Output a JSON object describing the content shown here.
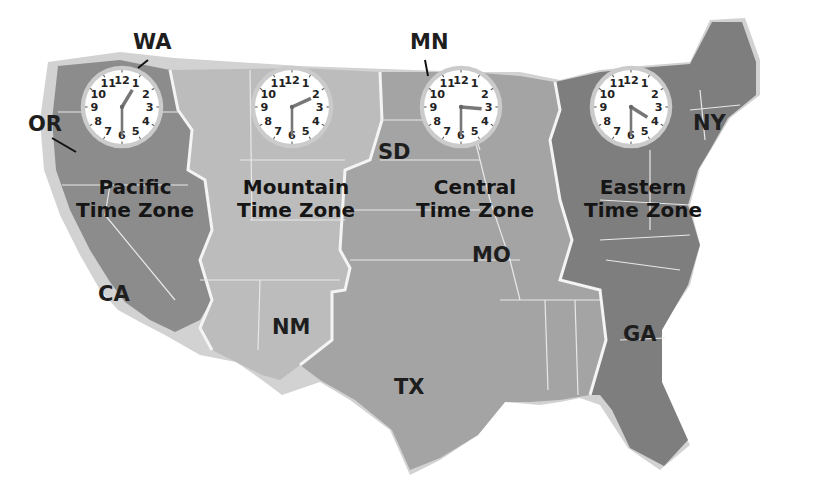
{
  "colors": {
    "pacific": "#8e8e8e",
    "mountain": "#b9b9b9",
    "central": "#a2a2a2",
    "eastern": "#7d7d7d",
    "coast": "#cfcfcf",
    "border": "#f2f2f2",
    "clock_face": "#ffffff",
    "clock_rim": "#c8c8c8"
  },
  "zones": [
    {
      "name": "Pacific",
      "line1": "Pacific",
      "line2": "Time Zone",
      "clock_time": "12:30",
      "hour": 12,
      "minute": 30
    },
    {
      "name": "Mountain",
      "line1": "Mountain",
      "line2": "Time Zone",
      "clock_time": "1:30",
      "hour": 1,
      "minute": 30
    },
    {
      "name": "Central",
      "line1": "Central",
      "line2": "Time Zone",
      "clock_time": "2:30",
      "hour": 2,
      "minute": 30
    },
    {
      "name": "Eastern",
      "line1": "Eastern",
      "line2": "Time Zone",
      "clock_time": "3:30",
      "hour": 3,
      "minute": 30
    }
  ],
  "states": {
    "wa": "WA",
    "or": "OR",
    "ca": "CA",
    "nm": "NM",
    "tx": "TX",
    "sd": "SD",
    "mn": "MN",
    "mo": "MO",
    "ny": "NY",
    "ga": "GA"
  },
  "clock_numbers": [
    "12",
    "1",
    "2",
    "3",
    "4",
    "5",
    "6",
    "7",
    "8",
    "9",
    "10",
    "11"
  ]
}
